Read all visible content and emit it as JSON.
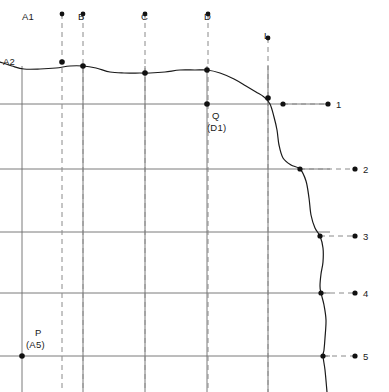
{
  "diagram": {
    "colors": {
      "background": "#ffffff",
      "grid": "#6b6b6b",
      "horizon_curve": "#1a1a1a",
      "well_trace": "#8a8a8a",
      "leader": "#8a8a8a",
      "marker": "#111111",
      "text": "#1a1a1a"
    },
    "well_traces": [
      {
        "label": "A1",
        "label_x": 22,
        "label_y": 11,
        "x": 62,
        "top_y": 14,
        "bottom_y": 392
      },
      {
        "label": "B",
        "label_x": 78,
        "label_y": 11,
        "x": 83,
        "top_y": 14,
        "bottom_y": 392
      },
      {
        "label": "C",
        "label_x": 141,
        "label_y": 11,
        "x": 145,
        "top_y": 14,
        "bottom_y": 392
      },
      {
        "label": "D",
        "label_x": 204,
        "label_y": 11,
        "x": 208,
        "top_y": 14,
        "bottom_y": 392
      },
      {
        "label": "L",
        "label_x": 264,
        "label_y": 30,
        "x": 268,
        "top_y": 38,
        "bottom_y": 392
      }
    ],
    "grid": {
      "vertical_x": [
        22,
        83,
        145,
        207,
        268
      ],
      "horizontal_y": [
        104,
        169,
        232,
        293,
        356
      ],
      "x_min": 0,
      "x_max": 330
    },
    "horizon_curve": {
      "name": "top-horizon",
      "points": [
        [
          0,
          62
        ],
        [
          12,
          66
        ],
        [
          24,
          69
        ],
        [
          40,
          69
        ],
        [
          56,
          68
        ],
        [
          70,
          66
        ],
        [
          83,
          66
        ],
        [
          96,
          68
        ],
        [
          110,
          72
        ],
        [
          124,
          73
        ],
        [
          140,
          73
        ],
        [
          150,
          73
        ],
        [
          165,
          72
        ],
        [
          180,
          70
        ],
        [
          195,
          70
        ],
        [
          207,
          70
        ],
        [
          220,
          73
        ],
        [
          234,
          79
        ],
        [
          246,
          86
        ],
        [
          256,
          92
        ],
        [
          264,
          97
        ],
        [
          270,
          104
        ],
        [
          274,
          117
        ],
        [
          277,
          130
        ],
        [
          279,
          145
        ],
        [
          283,
          158
        ],
        [
          291,
          165
        ],
        [
          300,
          169
        ],
        [
          306,
          181
        ],
        [
          309,
          198
        ],
        [
          311,
          215
        ],
        [
          315,
          228
        ],
        [
          320,
          236
        ],
        [
          323,
          248
        ],
        [
          323,
          262
        ],
        [
          321,
          274
        ],
        [
          320,
          286
        ],
        [
          321,
          293
        ],
        [
          324,
          305
        ],
        [
          326,
          320
        ],
        [
          325,
          338
        ],
        [
          324,
          350
        ],
        [
          323,
          356
        ],
        [
          325,
          370
        ],
        [
          327,
          392
        ]
      ]
    },
    "curve_points": [
      {
        "name": "A2-point",
        "x": 62,
        "y": 62
      },
      {
        "name": "B-point",
        "x": 83,
        "y": 66
      },
      {
        "name": "C-point",
        "x": 145,
        "y": 73
      },
      {
        "name": "D-point",
        "x": 207,
        "y": 70
      },
      {
        "name": "L-point",
        "x": 268,
        "y": 98
      }
    ],
    "annotations": [
      {
        "name": "label-a2",
        "text": "A2",
        "x": 3,
        "y": 56
      },
      {
        "name": "label-q",
        "text": "Q",
        "x": 212,
        "y": 110
      },
      {
        "name": "label-q-alias",
        "text": "(D1)",
        "x": 207,
        "y": 122
      },
      {
        "name": "label-p",
        "text": "P",
        "x": 35,
        "y": 327
      },
      {
        "name": "label-p-alias",
        "text": "(A5)",
        "x": 26,
        "y": 339
      }
    ],
    "annotation_points": [
      {
        "name": "point-q",
        "x": 207,
        "y": 104
      },
      {
        "name": "point-p",
        "x": 22,
        "y": 356
      }
    ],
    "markers": [
      {
        "label": "1",
        "y": 104,
        "anchor_x": 328,
        "dash_from_x": 283,
        "dash_to_x": 328,
        "label_x": 336,
        "label_y": 99
      },
      {
        "label": "2",
        "y": 169,
        "anchor_x": 355,
        "dash_from_x": 300,
        "dash_to_x": 355,
        "label_x": 363,
        "label_y": 164
      },
      {
        "label": "3",
        "y": 236,
        "anchor_x": 355,
        "dash_from_x": 320,
        "dash_to_x": 355,
        "label_x": 363,
        "label_y": 231
      },
      {
        "label": "4",
        "y": 293,
        "anchor_x": 355,
        "dash_from_x": 321,
        "dash_to_x": 355,
        "label_x": 363,
        "label_y": 288
      },
      {
        "label": "5",
        "y": 356,
        "anchor_x": 355,
        "dash_from_x": 323,
        "dash_to_x": 355,
        "label_x": 363,
        "label_y": 351
      }
    ],
    "marker_anchor_points": [
      {
        "name": "marker-anchor-1",
        "x": 283,
        "y": 104
      },
      {
        "name": "marker-anchor-2",
        "x": 300,
        "y": 169
      },
      {
        "name": "marker-anchor-3",
        "x": 320,
        "y": 236
      },
      {
        "name": "marker-anchor-4",
        "x": 321,
        "y": 293
      },
      {
        "name": "marker-anchor-5",
        "x": 323,
        "y": 356
      }
    ]
  }
}
